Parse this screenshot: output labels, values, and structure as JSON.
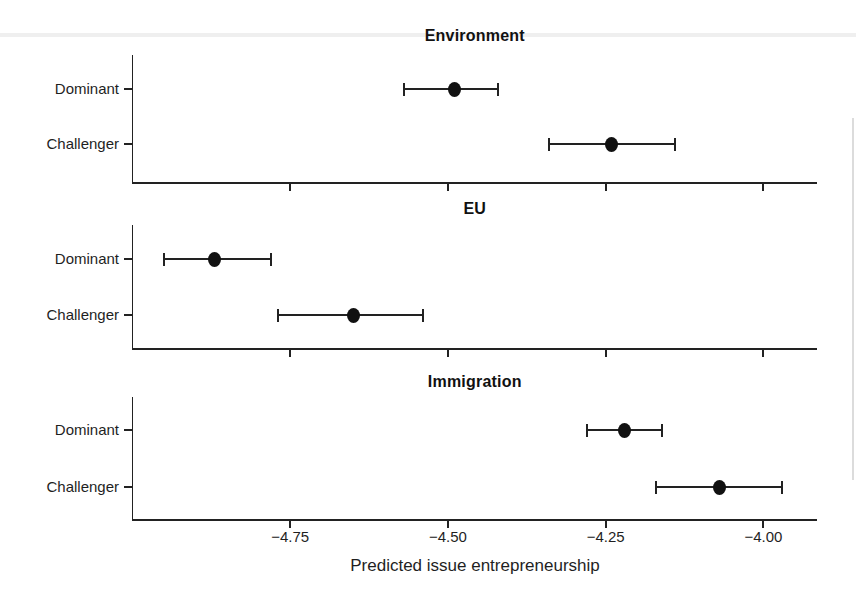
{
  "figure": {
    "background_color": "#ffffff",
    "ink_color": "#222222",
    "text_color": "#1f1f1f"
  },
  "chart_data": {
    "type": "scatter",
    "subtype": "dot-and-whisker coefficient plot, 3 stacked facets",
    "xlabel": "Predicted issue entrepreneurship",
    "xlim": [
      -5.0,
      -3.915
    ],
    "xtick_values": [
      -4.75,
      -4.5,
      -4.25,
      -4.0
    ],
    "xtick_labels": [
      "−4.75",
      "−4.50",
      "−4.25",
      "−4.00"
    ],
    "grid": "off",
    "legend": "none",
    "categories": [
      "Dominant",
      "Challenger"
    ],
    "panels": [
      {
        "title": "Environment",
        "points": [
          {
            "label": "Dominant",
            "estimate": -4.49,
            "ci_low": -4.57,
            "ci_high": -4.42
          },
          {
            "label": "Challenger",
            "estimate": -4.24,
            "ci_low": -4.34,
            "ci_high": -4.14
          }
        ]
      },
      {
        "title": "EU",
        "points": [
          {
            "label": "Dominant",
            "estimate": -4.87,
            "ci_low": -4.95,
            "ci_high": -4.78
          },
          {
            "label": "Challenger",
            "estimate": -4.65,
            "ci_low": -4.77,
            "ci_high": -4.54
          }
        ]
      },
      {
        "title": "Immigration",
        "points": [
          {
            "label": "Dominant",
            "estimate": -4.22,
            "ci_low": -4.28,
            "ci_high": -4.16
          },
          {
            "label": "Challenger",
            "estimate": -4.07,
            "ci_low": -4.17,
            "ci_high": -3.97
          }
        ]
      }
    ]
  }
}
